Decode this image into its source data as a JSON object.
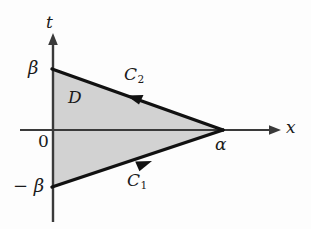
{
  "figure": {
    "background_color": "#fdfdfd",
    "region_fill_color": "#d2d2d2",
    "stroke_color": "#111111",
    "axis_color": "#3a3a3a"
  },
  "axes": {
    "horizontal": {
      "label": "x",
      "origin_label": "0",
      "line_y": 130,
      "x_start": 20,
      "x_end": 281,
      "arrow": "right"
    },
    "vertical": {
      "label": "t",
      "line_x": 53,
      "y_start": 35,
      "y_end": 222,
      "arrow": "up"
    }
  },
  "ticks": [
    {
      "name": "beta",
      "label": "β",
      "axis": "t",
      "value_y": 69
    },
    {
      "name": "negative-beta",
      "label": "− β",
      "axis": "t",
      "value_y": 187
    },
    {
      "name": "alpha",
      "label": "α",
      "axis": "x",
      "value_x": 222
    }
  ],
  "region": {
    "label": "D",
    "vertices": [
      {
        "name": "top-left",
        "x": 53,
        "y": 69
      },
      {
        "name": "right-apex",
        "x": 222,
        "y": 130
      },
      {
        "name": "bottom-left",
        "x": 53,
        "y": 187
      }
    ]
  },
  "curves": [
    {
      "name": "C1",
      "label": "C",
      "subscript": "1",
      "description": "lower boundary from (0,-β) to (α,0)",
      "direction": "right-up",
      "arrow_at": {
        "x": 143,
        "y": 163
      }
    },
    {
      "name": "C2",
      "label": "C",
      "subscript": "2",
      "description": "upper boundary from (α,0) to (0,β)",
      "direction": "left-up",
      "arrow_at": {
        "x": 133,
        "y": 98
      }
    }
  ]
}
